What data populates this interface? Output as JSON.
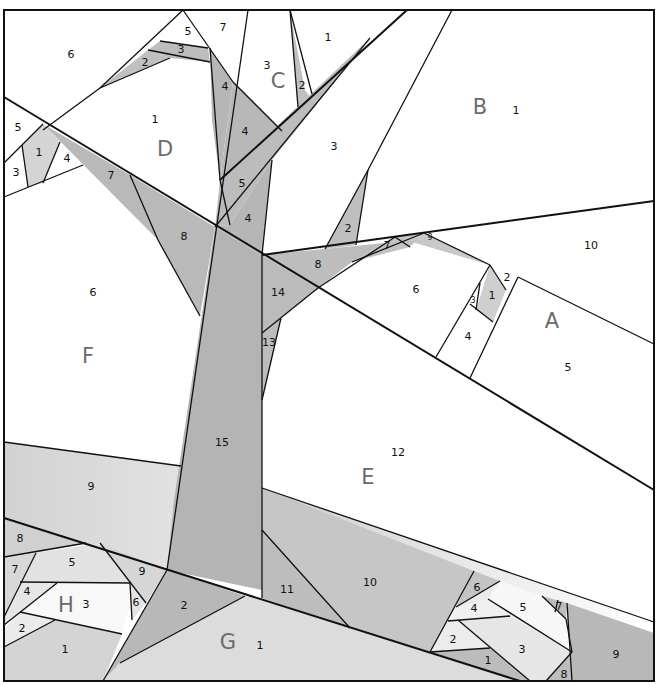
{
  "diagram": {
    "type": "foundation-paper-piecing-pattern",
    "colors": {
      "white": "#ffffff",
      "light_gray": "#dcdcdc",
      "mid_gray": "#c4c4c4",
      "dark_gray": "#ababab",
      "line": "#111111",
      "section_label": "#6b6b6b"
    },
    "sections": [
      {
        "letter": "A",
        "x": 552,
        "y": 322,
        "pieces": [
          {
            "n": "1",
            "x": 492,
            "y": 296
          },
          {
            "n": "2",
            "x": 507,
            "y": 278
          },
          {
            "n": "3",
            "x": 473,
            "y": 300
          },
          {
            "n": "4",
            "x": 468,
            "y": 337
          },
          {
            "n": "5",
            "x": 568,
            "y": 368
          },
          {
            "n": "6",
            "x": 416,
            "y": 290
          },
          {
            "n": "7",
            "x": 387,
            "y": 246
          },
          {
            "n": "8",
            "x": 318,
            "y": 265
          },
          {
            "n": "9",
            "x": 430,
            "y": 237
          },
          {
            "n": "10",
            "x": 591,
            "y": 246
          }
        ]
      },
      {
        "letter": "B",
        "x": 480,
        "y": 108,
        "pieces": [
          {
            "n": "1",
            "x": 516,
            "y": 111
          },
          {
            "n": "2",
            "x": 348,
            "y": 229
          },
          {
            "n": "3",
            "x": 334,
            "y": 147
          }
        ]
      },
      {
        "letter": "C",
        "x": 278,
        "y": 82,
        "pieces": [
          {
            "n": "1",
            "x": 328,
            "y": 38
          },
          {
            "n": "2",
            "x": 302,
            "y": 86
          },
          {
            "n": "3",
            "x": 267,
            "y": 66
          },
          {
            "n": "4",
            "x": 245,
            "y": 132
          },
          {
            "n": "5",
            "x": 242,
            "y": 184
          },
          {
            "n": "4",
            "x": 248,
            "y": 219
          }
        ]
      },
      {
        "letter": "D",
        "x": 165,
        "y": 150,
        "pieces": [
          {
            "n": "1",
            "x": 155,
            "y": 120
          },
          {
            "n": "2",
            "x": 145,
            "y": 63
          },
          {
            "n": "3",
            "x": 181,
            "y": 50
          },
          {
            "n": "4",
            "x": 225,
            "y": 87
          },
          {
            "n": "5",
            "x": 188,
            "y": 32
          },
          {
            "n": "6",
            "x": 71,
            "y": 55
          },
          {
            "n": "7",
            "x": 223,
            "y": 28
          },
          {
            "n": "1",
            "x": 39,
            "y": 153
          },
          {
            "n": "3",
            "x": 16,
            "y": 173
          },
          {
            "n": "4",
            "x": 67,
            "y": 159
          },
          {
            "n": "5",
            "x": 18,
            "y": 128
          },
          {
            "n": "7",
            "x": 111,
            "y": 176
          },
          {
            "n": "8",
            "x": 184,
            "y": 237
          }
        ]
      },
      {
        "letter": "E",
        "x": 368,
        "y": 478,
        "pieces": [
          {
            "n": "10",
            "x": 370,
            "y": 583
          },
          {
            "n": "11",
            "x": 287,
            "y": 590
          },
          {
            "n": "12",
            "x": 398,
            "y": 453
          },
          {
            "n": "13",
            "x": 269,
            "y": 343
          },
          {
            "n": "14",
            "x": 278,
            "y": 293
          },
          {
            "n": "15",
            "x": 222,
            "y": 443
          }
        ]
      },
      {
        "letter": "F",
        "x": 88,
        "y": 357,
        "pieces": [
          {
            "n": "6",
            "x": 93,
            "y": 293
          },
          {
            "n": "9",
            "x": 91,
            "y": 487
          }
        ]
      },
      {
        "letter": "G",
        "x": 228,
        "y": 643,
        "pieces": [
          {
            "n": "1",
            "x": 260,
            "y": 646
          },
          {
            "n": "2",
            "x": 184,
            "y": 606
          }
        ]
      },
      {
        "letter": "H",
        "x": 66,
        "y": 606,
        "pieces": [
          {
            "n": "1",
            "x": 65,
            "y": 650
          },
          {
            "n": "2",
            "x": 22,
            "y": 629
          },
          {
            "n": "3",
            "x": 86,
            "y": 605
          },
          {
            "n": "4",
            "x": 27,
            "y": 592
          },
          {
            "n": "5",
            "x": 72,
            "y": 563
          },
          {
            "n": "6",
            "x": 136,
            "y": 603
          },
          {
            "n": "7",
            "x": 15,
            "y": 570
          },
          {
            "n": "8",
            "x": 20,
            "y": 539
          },
          {
            "n": "9",
            "x": 142,
            "y": 572
          }
        ]
      },
      {
        "letter": "",
        "x": 0,
        "y": 0,
        "pieces": [
          {
            "n": "1",
            "x": 488,
            "y": 661
          },
          {
            "n": "2",
            "x": 453,
            "y": 640
          },
          {
            "n": "3",
            "x": 522,
            "y": 650
          },
          {
            "n": "4",
            "x": 474,
            "y": 609
          },
          {
            "n": "5",
            "x": 523,
            "y": 608
          },
          {
            "n": "6",
            "x": 477,
            "y": 588
          },
          {
            "n": "7",
            "x": 559,
            "y": 607
          },
          {
            "n": "8",
            "x": 564,
            "y": 675
          },
          {
            "n": "9",
            "x": 616,
            "y": 655
          }
        ]
      }
    ]
  }
}
